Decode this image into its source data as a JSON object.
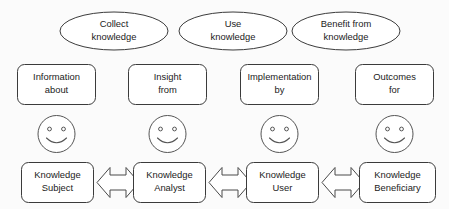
{
  "diagram": {
    "background_color": "#fbfbfb",
    "stroke_color": "#3b3b3b",
    "fill_color": "#ffffff",
    "text_color": "#1b1b1b",
    "activities": [
      {
        "id": "collect",
        "line1": "Collect",
        "line2": "knowledge"
      },
      {
        "id": "use",
        "line1": "Use",
        "line2": "knowledge"
      },
      {
        "id": "benefit",
        "line1": "Benefit from",
        "line2": "knowledge"
      }
    ],
    "relations": [
      {
        "id": "information",
        "line1": "Information",
        "line2": "about"
      },
      {
        "id": "insight",
        "line1": "Insight",
        "line2": "from"
      },
      {
        "id": "implementation",
        "line1": "Implementation",
        "line2": "by"
      },
      {
        "id": "outcomes",
        "line1": "Outcomes",
        "line2": "for"
      }
    ],
    "actors": [
      {
        "id": "subject",
        "line1": "Knowledge",
        "line2": "Subject"
      },
      {
        "id": "analyst",
        "line1": "Knowledge",
        "line2": "Analyst"
      },
      {
        "id": "user",
        "line1": "Knowledge",
        "line2": "User"
      },
      {
        "id": "beneficiary",
        "line1": "Knowledge",
        "line2": "Beneficiary"
      }
    ],
    "faces": [
      {
        "id": "face-subject",
        "expression": "smiley-face"
      },
      {
        "id": "face-analyst",
        "expression": "smiley-face"
      },
      {
        "id": "face-user",
        "expression": "smiley-face"
      },
      {
        "id": "face-beneficiary",
        "expression": "smiley-face"
      }
    ],
    "connectors": [
      {
        "id": "subject-analyst",
        "kind": "double-headed-arrow"
      },
      {
        "id": "analyst-user",
        "kind": "double-headed-arrow"
      },
      {
        "id": "user-beneficiary",
        "kind": "double-headed-arrow"
      }
    ]
  }
}
